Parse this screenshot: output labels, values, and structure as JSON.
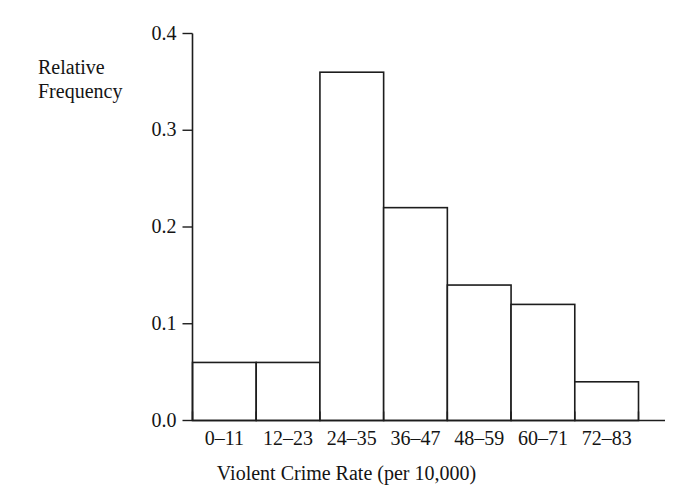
{
  "chart_data": {
    "type": "bar",
    "title": "",
    "subtitle": "",
    "xlabel": "Violent Crime Rate (per 10,000)",
    "ylabel": "Relative Frequency",
    "ylabel_lines": [
      "Relative",
      "Frequency"
    ],
    "categories": [
      "0–11",
      "12–23",
      "24–35",
      "36–47",
      "48–59",
      "60–71",
      "72–83"
    ],
    "values": [
      0.06,
      0.06,
      0.36,
      0.22,
      0.14,
      0.12,
      0.04
    ],
    "ylim": [
      0.0,
      0.4
    ],
    "yticks": [
      0.0,
      0.1,
      0.2,
      0.3,
      0.4
    ],
    "ytick_labels": [
      "0.0",
      "0.1",
      "0.2",
      "0.3",
      "0.4"
    ],
    "grid": false,
    "legend": false,
    "legend_position": "none",
    "bar_fill_color": "#ffffff",
    "bar_edge_color": "#1d1d1d",
    "axis_color": "#1d1d1d",
    "text_color": "#141414",
    "background_color": "#ffffff",
    "bar_gap": 0,
    "annotations": []
  }
}
